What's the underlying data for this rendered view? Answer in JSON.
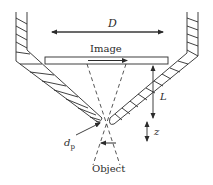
{
  "diagram": {
    "labels": {
      "D": "D",
      "image": "Image",
      "L": "L",
      "z": "z",
      "dp_main": "d",
      "dp_sub": "p",
      "object": "Object"
    },
    "colors": {
      "stroke": "#2b2b2b",
      "background": "#ffffff"
    }
  }
}
